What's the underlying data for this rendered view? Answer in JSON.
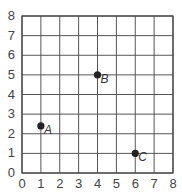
{
  "chart_data": {
    "type": "scatter",
    "title": "",
    "xlabel": "",
    "ylabel": "",
    "xlim": [
      0,
      8
    ],
    "ylim": [
      0,
      8
    ],
    "grid": true,
    "x_ticks": [
      "0",
      "1",
      "2",
      "3",
      "4",
      "5",
      "6",
      "7",
      "8"
    ],
    "y_ticks": [
      "0",
      "1",
      "2",
      "3",
      "4",
      "5",
      "6",
      "7",
      "8"
    ],
    "points": [
      {
        "label": "A",
        "x": 1,
        "y": 2.4
      },
      {
        "label": "B",
        "x": 4,
        "y": 5
      },
      {
        "label": "C",
        "x": 6,
        "y": 1
      }
    ]
  },
  "colors": {
    "grid": "#555555",
    "point": "#222222",
    "text": "#444444"
  }
}
